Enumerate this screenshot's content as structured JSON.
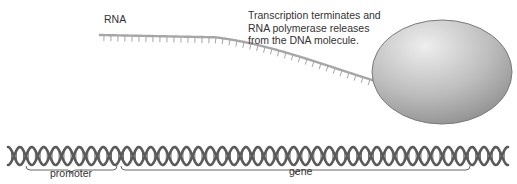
{
  "labels": {
    "rna": "RNA",
    "caption_lines": [
      "Transcription terminates and",
      "RNA polymerase releases",
      "from the DNA molecule."
    ],
    "promoter": "promoter",
    "gene": "gene"
  },
  "colors": {
    "dna_strand": "#5a5a5a",
    "dna_rungs": "#6e6e6e",
    "rna_strand": "#a6a6a6",
    "polymerase_light": "#e6e6e6",
    "polymerase_dark": "#8e8e8e",
    "brace": "#666666",
    "text": "#333333"
  },
  "dna": {
    "x_start": 8,
    "x_end": 508,
    "y_top": 147,
    "y_bottom": 165,
    "period": 23.8
  },
  "rna": {
    "start": [
      100,
      35
    ],
    "flat_until": 215,
    "end": [
      462,
      101
    ],
    "tick_length": 6,
    "tick_spacing": 7
  },
  "polymerase": {
    "cx": 442,
    "cy": 72,
    "rx": 70,
    "ry": 52
  },
  "braces": [
    {
      "name": "promoter",
      "x1": 26,
      "x2": 117,
      "y": 170
    },
    {
      "name": "gene",
      "x1": 121,
      "x2": 470,
      "y": 170
    }
  ]
}
